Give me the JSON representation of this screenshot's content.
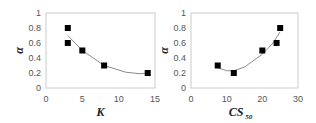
{
  "chart_data": [
    {
      "type": "scatter",
      "title": "",
      "xlabel": "K",
      "ylabel": "α",
      "xlim": [
        0,
        15
      ],
      "ylim": [
        0,
        1
      ],
      "xticks": [
        "0",
        "5",
        "10",
        "15"
      ],
      "yticks": [
        "0",
        "0.2",
        "0.4",
        "0.6",
        "0.8",
        "1"
      ],
      "grid": false,
      "legend": null,
      "series": [
        {
          "name": "data",
          "marker": "square",
          "points": [
            [
              3,
              0.8
            ],
            [
              3,
              0.6
            ],
            [
              5,
              0.5
            ],
            [
              8,
              0.3
            ],
            [
              14,
              0.2
            ]
          ]
        },
        {
          "name": "trend",
          "type": "line",
          "fit": "polynomial-2",
          "points": [
            [
              3,
              0.7
            ],
            [
              5,
              0.5
            ],
            [
              8,
              0.3
            ],
            [
              11,
              0.21
            ],
            [
              13,
              0.19
            ],
            [
              14,
              0.2
            ]
          ]
        }
      ]
    },
    {
      "type": "scatter",
      "title": "",
      "xlabel": "CS",
      "xlabel_subscript": "50",
      "ylabel": "α",
      "xlim": [
        0,
        30
      ],
      "ylim": [
        0,
        1
      ],
      "xticks": [
        "0",
        "10",
        "20",
        "30"
      ],
      "yticks": [
        "0",
        "0.2",
        "0.4",
        "0.6",
        "0.8",
        "1"
      ],
      "grid": false,
      "legend": null,
      "series": [
        {
          "name": "data",
          "marker": "square",
          "points": [
            [
              7.5,
              0.3
            ],
            [
              12,
              0.2
            ],
            [
              20,
              0.5
            ],
            [
              24,
              0.6
            ],
            [
              25,
              0.8
            ]
          ]
        },
        {
          "name": "trend",
          "type": "line",
          "fit": "polynomial-2",
          "points": [
            [
              7.5,
              0.27
            ],
            [
              10,
              0.23
            ],
            [
              12,
              0.23
            ],
            [
              15,
              0.28
            ],
            [
              20,
              0.45
            ],
            [
              23,
              0.6
            ],
            [
              25,
              0.75
            ]
          ]
        }
      ]
    }
  ],
  "colors": {
    "marker": "#000000",
    "trend": "#8a8a8a",
    "frame": "#cccccc",
    "tick_text": "#555555"
  }
}
